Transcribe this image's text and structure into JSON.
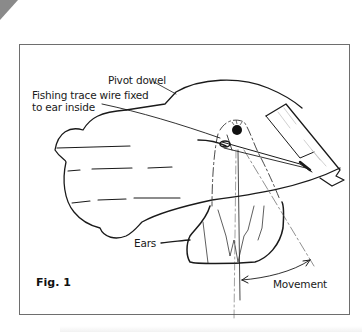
{
  "figure": {
    "caption": "Fig. 1",
    "labels": {
      "pivot": "Pivot dowel",
      "wire_line1": "Fishing trace wire fixed",
      "wire_line2": "to ear inside",
      "ears": "Ears",
      "movement": "Movement"
    },
    "colors": {
      "ink": "#1a1a1a",
      "frame": "#6e6e6e",
      "corner": "#8a8a8a",
      "background": "#ffffff"
    }
  }
}
